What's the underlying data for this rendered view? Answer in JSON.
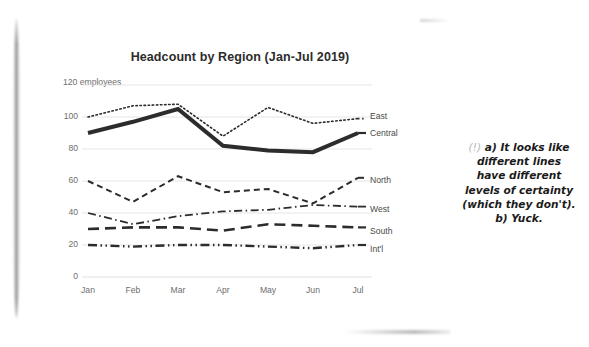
{
  "page": {
    "background_color": "#ffffff",
    "ink_color": "#2c2c2c",
    "axis_text_color": "#6d6d6d"
  },
  "annotation": {
    "marker": "(!)",
    "lines": [
      "a) It looks like",
      "different lines",
      "have different",
      "levels of certainty",
      "(which they don't).",
      "b) Yuck."
    ]
  },
  "chart_data": {
    "type": "line",
    "title": "Headcount by Region (Jan-Jul 2019)",
    "xlabel": "",
    "ylabel": "",
    "y_axis_note": "employees",
    "categories": [
      "Jan",
      "Feb",
      "Mar",
      "Apr",
      "May",
      "Jun",
      "Jul"
    ],
    "yticks": [
      0,
      20,
      40,
      60,
      80,
      100,
      120
    ],
    "ytick_labels": [
      "0",
      "20",
      "40",
      "60",
      "80",
      "100",
      "120"
    ],
    "ylim": [
      0,
      120
    ],
    "grid": "horizontal",
    "legend_position": "right-of-line-end",
    "series": [
      {
        "name": "East",
        "values": [
          100,
          107,
          108,
          88,
          106,
          96,
          99
        ],
        "style": "dotted",
        "width": 1.6,
        "color": "#2c2c2c"
      },
      {
        "name": "Central",
        "values": [
          90,
          97,
          105,
          82,
          79,
          78,
          90
        ],
        "style": "solid",
        "width": 4.0,
        "color": "#2c2c2c"
      },
      {
        "name": "North",
        "values": [
          60,
          47,
          63,
          53,
          55,
          46,
          62
        ],
        "style": "dashed",
        "width": 2.0,
        "color": "#2c2c2c"
      },
      {
        "name": "West",
        "values": [
          40,
          33,
          38,
          41,
          42,
          45,
          44
        ],
        "style": "dash-dot",
        "width": 1.8,
        "color": "#2c2c2c"
      },
      {
        "name": "South",
        "values": [
          30,
          31,
          31,
          29,
          33,
          32,
          31
        ],
        "style": "long-dash",
        "width": 2.6,
        "color": "#2c2c2c"
      },
      {
        "name": "Int'l",
        "values": [
          20,
          19,
          20,
          20,
          19,
          18,
          20
        ],
        "style": "dash-dot-dot",
        "width": 2.4,
        "color": "#2c2c2c"
      }
    ]
  }
}
